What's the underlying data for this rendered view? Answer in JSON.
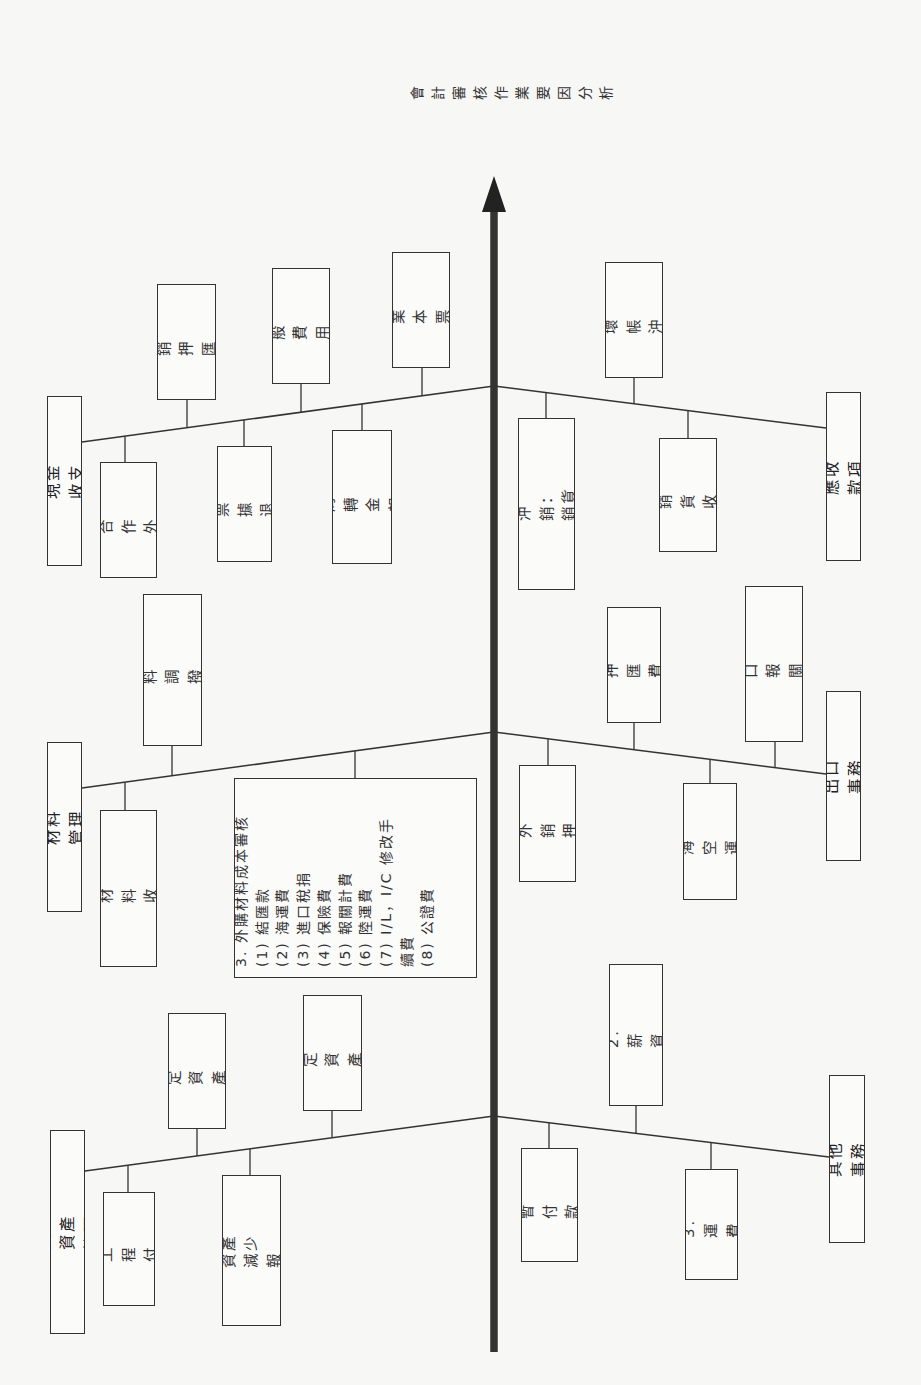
{
  "title": "會計審核作業\n要因分析",
  "colors": {
    "line": "#333333",
    "spine": "#222222",
    "background": "#f7f7f5"
  },
  "spine": {
    "x": 494,
    "top": 176,
    "bottom": 1352,
    "arrow_head_base": 212
  },
  "categories": [
    {
      "id": "cash",
      "label": "一、現金收支審核",
      "side": "left",
      "box": [
        47,
        396,
        35,
        170
      ],
      "branch": [
        82,
        442,
        494,
        386
      ],
      "items": [
        {
          "label": "1. 內銷合作\n外銷繳款",
          "box": [
            100,
            462,
            57,
            116
          ],
          "cx": 125,
          "pos": "below"
        },
        {
          "label": "2. 外銷押匯\n繳款",
          "box": [
            157,
            284,
            59,
            116
          ],
          "cx": 187,
          "pos": "above"
        },
        {
          "label": "3. 票據退延",
          "box": [
            217,
            446,
            55,
            116
          ],
          "cx": 244,
          "pos": "below"
        },
        {
          "label": "4. 一般費用\n付款",
          "box": [
            272,
            268,
            58,
            116
          ],
          "cx": 301,
          "pos": "above"
        },
        {
          "label": "5. 周轉金報銷",
          "box": [
            332,
            430,
            60,
            134
          ],
          "cx": 362,
          "pos": "below"
        },
        {
          "label": "6. 商業本票\n保證",
          "box": [
            392,
            252,
            58,
            116
          ],
          "cx": 422,
          "pos": "above"
        }
      ]
    },
    {
      "id": "receivable",
      "label": "二、應收款項審核",
      "side": "right",
      "box": [
        826,
        392,
        35,
        169
      ],
      "branch": [
        494,
        386,
        826,
        428
      ],
      "items": [
        {
          "label": "1. 應收帳款沖銷：\n銷貨退回與折讓",
          "box": [
            518,
            418,
            57,
            172
          ],
          "cx": 546,
          "pos": "below"
        },
        {
          "label": "2. 壞帳沖銷",
          "box": [
            605,
            262,
            58,
            116
          ],
          "cx": 634,
          "pos": "above"
        },
        {
          "label": "3. 銷貨收入",
          "box": [
            659,
            438,
            58,
            114
          ],
          "cx": 688,
          "pos": "below"
        }
      ]
    },
    {
      "id": "material",
      "label": "三、材料管理審核",
      "side": "left",
      "box": [
        47,
        742,
        35,
        170
      ],
      "branch": [
        82,
        788,
        494,
        732
      ],
      "items": [
        {
          "label": "1. 內購材料收料\n付款",
          "box": [
            100,
            810,
            57,
            157
          ],
          "cx": 125,
          "pos": "below"
        },
        {
          "label": "2. 材料調撥交運",
          "box": [
            143,
            594,
            59,
            152
          ],
          "cx": 172,
          "pos": "above"
        },
        {
          "label": "3. 外購材料成本審核\n  (1) 結匯款\n  (2) 海運費\n  (3) 進口稅捐\n  (4) 保險費\n  (5) 報關計費\n  (6) 陸運費\n  (7) I/L，I/C 修改手\n          續費\n  (8) 公證費",
          "box": [
            234,
            778,
            243,
            200
          ],
          "cx": 355,
          "pos": "below",
          "big": true
        }
      ]
    },
    {
      "id": "export",
      "label": "四、出口事務審核",
      "side": "right",
      "box": [
        826,
        691,
        35,
        170
      ],
      "branch": [
        494,
        732,
        826,
        774
      ],
      "items": [
        {
          "label": "1. 外銷押匯",
          "box": [
            519,
            765,
            57,
            117
          ],
          "cx": 548,
          "pos": "below"
        },
        {
          "label": "2. 押匯費用",
          "box": [
            607,
            607,
            54,
            116
          ],
          "cx": 634,
          "pos": "above"
        },
        {
          "label": "3. 海空運費",
          "box": [
            683,
            783,
            54,
            117
          ],
          "cx": 710,
          "pos": "below"
        },
        {
          "label": "4. 出口報關計費",
          "box": [
            745,
            586,
            58,
            156
          ],
          "cx": 775,
          "pos": "above"
        }
      ]
    },
    {
      "id": "fixed-asset",
      "label": "五、固定資產管理審核",
      "side": "left",
      "box": [
        50,
        1130,
        35,
        204
      ],
      "branch": [
        85,
        1171,
        494,
        1116
      ],
      "items": [
        {
          "label": "1. 工程付款",
          "box": [
            103,
            1192,
            52,
            114
          ],
          "cx": 128,
          "pos": "below"
        },
        {
          "label": "2. 固定資產\n增加",
          "box": [
            168,
            1013,
            58,
            116
          ],
          "cx": 197,
          "pos": "above"
        },
        {
          "label": "3. 固定資產減少\n報廢、標售",
          "box": [
            222,
            1175,
            59,
            151
          ],
          "cx": 250,
          "pos": "below"
        },
        {
          "label": "4. 固定資產\n轉移",
          "box": [
            303,
            995,
            59,
            116
          ],
          "cx": 332,
          "pos": "above"
        }
      ]
    },
    {
      "id": "other",
      "label": "六、其他事務審核",
      "side": "right",
      "box": [
        829,
        1075,
        36,
        168
      ],
      "branch": [
        494,
        1116,
        829,
        1157
      ],
      "items": [
        {
          "label": "1. 暫付款項",
          "box": [
            521,
            1148,
            57,
            114
          ],
          "cx": 549,
          "pos": "below"
        },
        {
          "label": "2. 薪資",
          "box": [
            609,
            964,
            54,
            142
          ],
          "cx": 636,
          "pos": "above"
        },
        {
          "label": "3. 運費",
          "box": [
            685,
            1169,
            53,
            111
          ],
          "cx": 711,
          "pos": "below"
        }
      ]
    }
  ]
}
